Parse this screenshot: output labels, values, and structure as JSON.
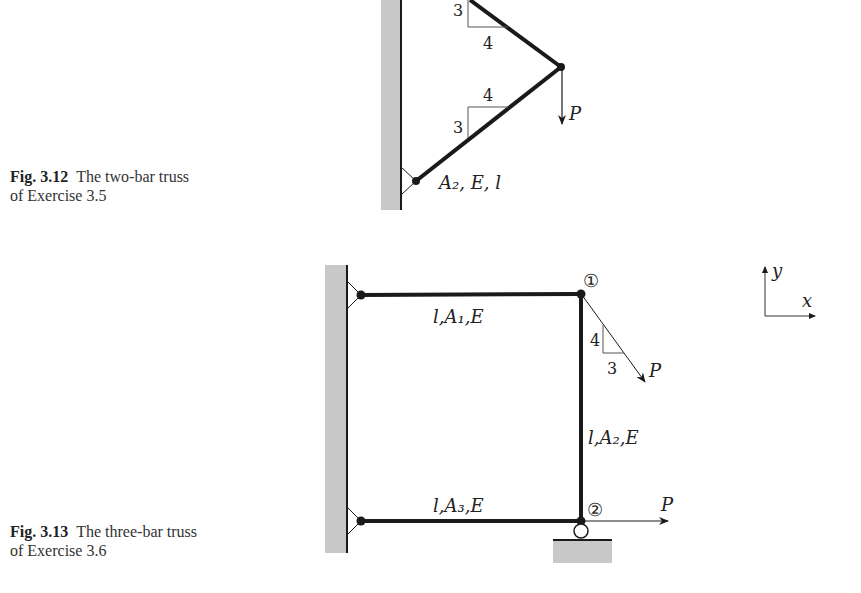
{
  "figures": [
    {
      "caption_number": "Fig. 3.12",
      "caption_line1": "The two-bar truss",
      "caption_line2": "of Exercise 3.5",
      "slope_top": {
        "rise": "3",
        "run": "4"
      },
      "slope_bottom": {
        "rise": "3",
        "run": "4"
      },
      "load_label": "P",
      "bar_label": "A₂, E, l"
    },
    {
      "caption_number": "Fig. 3.13",
      "caption_line1": "The three-bar truss",
      "caption_line2": "of Exercise 3.6",
      "node1": "①",
      "node2": "②",
      "bar1_label": "l,A₁,E",
      "bar2_label": "l,A₂,E",
      "bar3_label": "l,A₃,E",
      "slope": {
        "rise": "4",
        "run": "3"
      },
      "load1_label": "P",
      "load2_label": "P",
      "axes": {
        "x": "x",
        "y": "y"
      }
    }
  ],
  "colors": {
    "ground": "#c8c8c8",
    "member": "#1a1a1a"
  }
}
